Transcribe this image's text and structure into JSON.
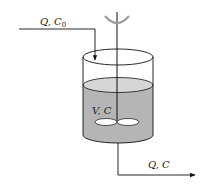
{
  "diagram": {
    "inlet": {
      "label_main": "Q, C",
      "label_sub": "0"
    },
    "tank": {
      "label": "V, C"
    },
    "outlet": {
      "label": "Q, C"
    },
    "colors": {
      "line": "#111111",
      "liquid": "#b5b5b5",
      "liquid_surface": "#d6d6d6",
      "impeller": "#ffffff",
      "background": "#ffffff"
    }
  }
}
